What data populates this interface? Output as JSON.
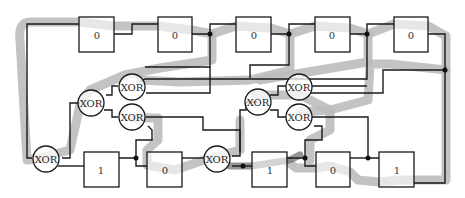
{
  "diagram": {
    "type": "shift-register circuit with XOR feedback",
    "top_registers": [
      {
        "id": "t1",
        "value": "0"
      },
      {
        "id": "t2",
        "value": "0"
      },
      {
        "id": "t3",
        "value": "0"
      },
      {
        "id": "t4",
        "value": "0"
      },
      {
        "id": "t5",
        "value": "0"
      }
    ],
    "bottom_registers": [
      {
        "id": "b1",
        "value": "1"
      },
      {
        "id": "b2",
        "value": "0"
      },
      {
        "id": "b3",
        "value": "1"
      },
      {
        "id": "b4",
        "value": "0"
      },
      {
        "id": "b5",
        "value": "1"
      }
    ],
    "gates": [
      {
        "id": "g1",
        "label": "XOR"
      },
      {
        "id": "g2",
        "label": "XOR"
      },
      {
        "id": "g3",
        "label": "XOR"
      },
      {
        "id": "g4",
        "label": "XOR"
      },
      {
        "id": "g5",
        "label": "XOR"
      },
      {
        "id": "g6",
        "label": "XOR"
      },
      {
        "id": "g7",
        "label": "XOR"
      },
      {
        "id": "g8",
        "label": "XOR"
      }
    ],
    "colors": {
      "wire": "#1a1a1a",
      "highlight_path": "#bdbdbd",
      "highlight_dark": "#7a7a7a"
    }
  }
}
